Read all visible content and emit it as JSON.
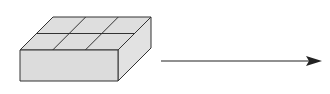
{
  "diagram": {
    "box": {
      "grid_rows": 2,
      "grid_cols": 3,
      "fill_color": "#dcdcdc",
      "stroke_color": "#333333"
    },
    "arrow": {
      "direction": "right",
      "color": "#222222"
    }
  }
}
